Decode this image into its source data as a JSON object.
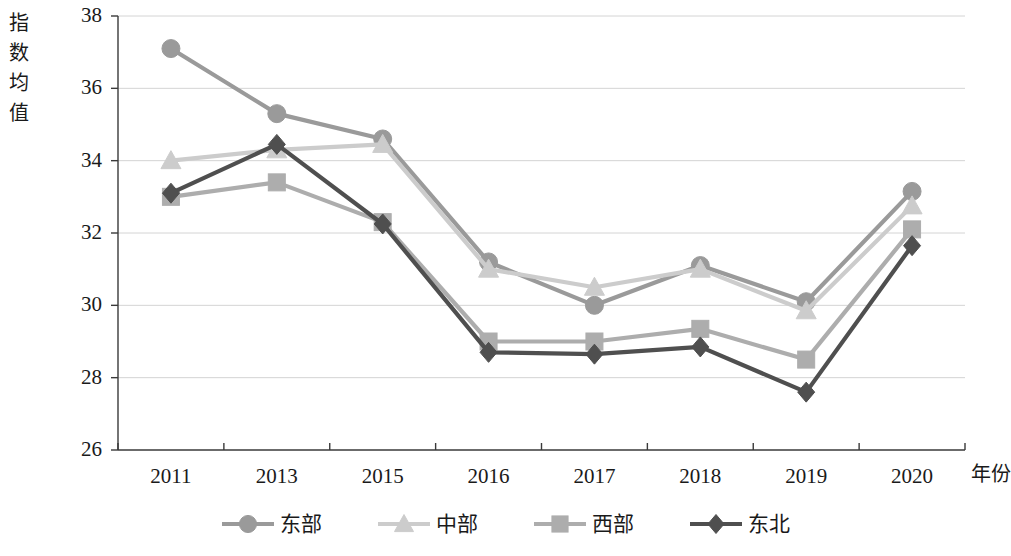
{
  "chart_data": {
    "type": "line",
    "title": "",
    "xlabel": "年份",
    "ylabel": "指数均值",
    "categories": [
      "2011",
      "2013",
      "2015",
      "2016",
      "2017",
      "2018",
      "2019",
      "2020"
    ],
    "ylim": [
      26,
      38
    ],
    "yticks": [
      "26",
      "28",
      "30",
      "32",
      "34",
      "36",
      "38"
    ],
    "grid": true,
    "legend_position": "bottom",
    "series": [
      {
        "name": "东部",
        "marker": "circle",
        "color": "#9a9a9a",
        "values": [
          37.1,
          35.3,
          34.6,
          31.2,
          30.0,
          31.1,
          30.1,
          33.15
        ]
      },
      {
        "name": "中部",
        "marker": "triangle",
        "color": "#cccccc",
        "values": [
          34.0,
          34.3,
          34.45,
          31.0,
          30.5,
          31.0,
          29.85,
          32.75
        ]
      },
      {
        "name": "西部",
        "marker": "square",
        "color": "#adadad",
        "values": [
          33.0,
          33.4,
          32.3,
          29.0,
          29.0,
          29.35,
          28.5,
          32.1
        ]
      },
      {
        "name": "东北",
        "marker": "diamond",
        "color": "#4f4f4f",
        "values": [
          33.1,
          34.45,
          32.25,
          28.7,
          28.65,
          28.85,
          27.6,
          31.65
        ]
      }
    ]
  },
  "axes": {
    "y_title_chars": [
      "指",
      "数",
      "均",
      "值"
    ],
    "x_title": "年份",
    "axis_color": "#3a3a3a",
    "grid_color": "#d4d4d4"
  }
}
